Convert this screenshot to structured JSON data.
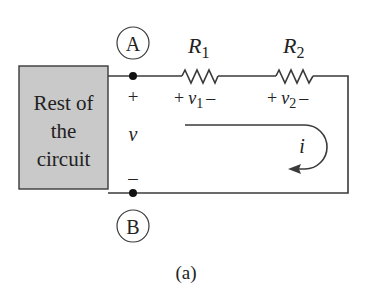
{
  "figure": {
    "caption": "(a)",
    "block": {
      "label_lines": [
        "Rest of",
        "the",
        "circuit"
      ],
      "fill": "#c9c9c9"
    },
    "nodes": {
      "a": {
        "label": "A"
      },
      "b": {
        "label": "B"
      }
    },
    "port_voltage": {
      "plus": "+",
      "symbol": "v",
      "minus": "–"
    },
    "resistors": [
      {
        "name": "R",
        "sub": "1",
        "v_plus": "+",
        "v_symbol": "v",
        "v_sub": "1",
        "v_minus": "–"
      },
      {
        "name": "R",
        "sub": "2",
        "v_plus": "+",
        "v_symbol": "v",
        "v_sub": "2",
        "v_minus": "–"
      }
    ],
    "current": {
      "symbol": "i"
    },
    "colors": {
      "wire": "#3a3a3a",
      "text": "#222222",
      "block_fill": "#c9c9c9"
    }
  }
}
